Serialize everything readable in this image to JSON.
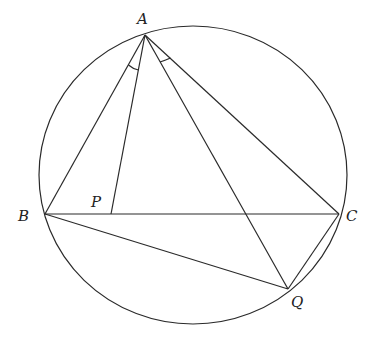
{
  "diagram": {
    "type": "geometry",
    "circle": {
      "cx": 193,
      "cy": 175,
      "rx": 154,
      "ry": 149
    },
    "points": {
      "A": {
        "x": 145,
        "y": 35,
        "label": "A"
      },
      "B": {
        "x": 45,
        "y": 214,
        "label": "B"
      },
      "C": {
        "x": 339,
        "y": 214,
        "label": "C"
      },
      "P": {
        "x": 111,
        "y": 214,
        "label": "P"
      },
      "Q": {
        "x": 288,
        "y": 289,
        "label": "Q"
      }
    },
    "segments": [
      "AB",
      "AC",
      "BC",
      "AP",
      "AQ",
      "BQ",
      "CQ"
    ],
    "equal_angles": [
      "BAP",
      "QAC"
    ]
  }
}
